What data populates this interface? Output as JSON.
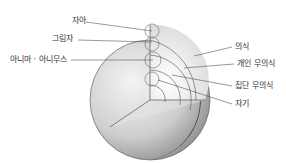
{
  "diagram": {
    "title": "",
    "labels_left": [
      {
        "id": "self-ego",
        "text": "자아"
      },
      {
        "id": "shadow",
        "text": "그림자"
      },
      {
        "id": "anima-animus",
        "text": "아니마 · 아니무스"
      }
    ],
    "labels_right": [
      {
        "id": "consciousness",
        "text": "의식"
      },
      {
        "id": "personal-unconscious",
        "text": "개인 무의식"
      },
      {
        "id": "collective-unconscious",
        "text": "집단 무의식"
      },
      {
        "id": "self",
        "text": "자기"
      }
    ]
  }
}
